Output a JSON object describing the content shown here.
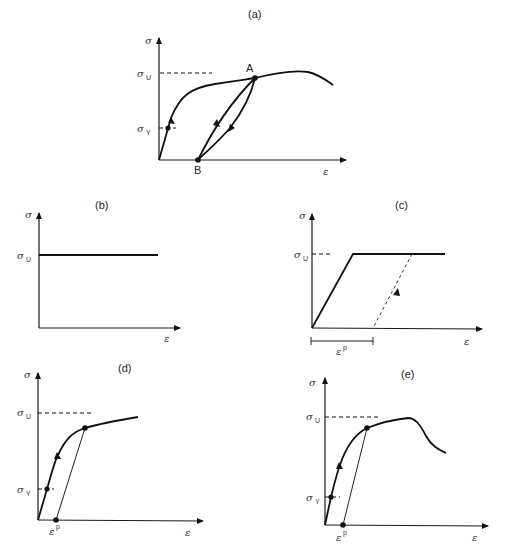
{
  "figure": {
    "panels": [
      {
        "id": "a",
        "title": "(a)",
        "ylabel": "σ",
        "xlabel": "ε",
        "sigma_u": "σ",
        "sigma_u_sub": "U",
        "sigma_y": "σ",
        "sigma_y_sub": "Y",
        "point_a": "A",
        "point_b": "B"
      },
      {
        "id": "b",
        "title": "(b)",
        "ylabel": "σ",
        "xlabel": "ε",
        "sigma_u": "σ",
        "sigma_u_sub": "U"
      },
      {
        "id": "c",
        "title": "(c)",
        "ylabel": "σ",
        "xlabel": "ε",
        "sigma_u": "σ",
        "sigma_u_sub": "U",
        "eps_p": "ε",
        "eps_p_sup": "p"
      },
      {
        "id": "d",
        "title": "(d)",
        "ylabel": "σ",
        "xlabel": "ε",
        "sigma_u": "σ",
        "sigma_u_sub": "U",
        "sigma_y": "σ",
        "sigma_y_sub": "Y",
        "eps_p": "ε",
        "eps_p_sup": "p"
      },
      {
        "id": "e",
        "title": "(e)",
        "ylabel": "σ",
        "xlabel": "ε",
        "sigma_u": "σ",
        "sigma_u_sub": "U",
        "sigma_y": "σ",
        "sigma_y_sub": "Y",
        "eps_p": "ε",
        "eps_p_sup": "p"
      }
    ]
  }
}
